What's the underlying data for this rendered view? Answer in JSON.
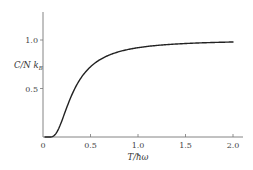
{
  "chart_data": {
    "type": "line",
    "title": "",
    "xlabel": "T/ħω",
    "ylabel": "C/N k_B",
    "xlim": [
      0,
      2.1
    ],
    "ylim": [
      0,
      1.25
    ],
    "grid": false,
    "legend": null,
    "x_ticks": [
      "0",
      "0.5",
      "1.0",
      "1.5",
      "2.0"
    ],
    "y_ticks": [
      "0.5",
      "1.0"
    ],
    "series": [
      {
        "name": "C/Nk_B",
        "x": [
          0.05,
          0.075,
          0.1,
          0.125,
          0.15,
          0.175,
          0.2,
          0.225,
          0.25,
          0.3,
          0.35,
          0.4,
          0.45,
          0.5,
          0.6,
          0.7,
          0.8,
          0.9,
          1.0,
          1.2,
          1.4,
          1.6,
          1.8,
          2.0
        ],
        "values": [
          0.0,
          0.003,
          0.005,
          0.021,
          0.057,
          0.113,
          0.171,
          0.237,
          0.301,
          0.414,
          0.508,
          0.577,
          0.634,
          0.724,
          0.791,
          0.838,
          0.872,
          0.9,
          0.921,
          0.944,
          0.958,
          0.968,
          0.975,
          0.979
        ]
      }
    ]
  },
  "axes": {
    "x_label_main": "T/",
    "x_label_sym": "ħω",
    "y_label_main": "C/N ",
    "y_label_sub": "B",
    "y_label_k": "k",
    "x_tick_labels": [
      "0",
      "0.5",
      "1.0",
      "1.5",
      "2.0"
    ],
    "y_tick_labels": [
      "0.5",
      "1.0"
    ]
  }
}
